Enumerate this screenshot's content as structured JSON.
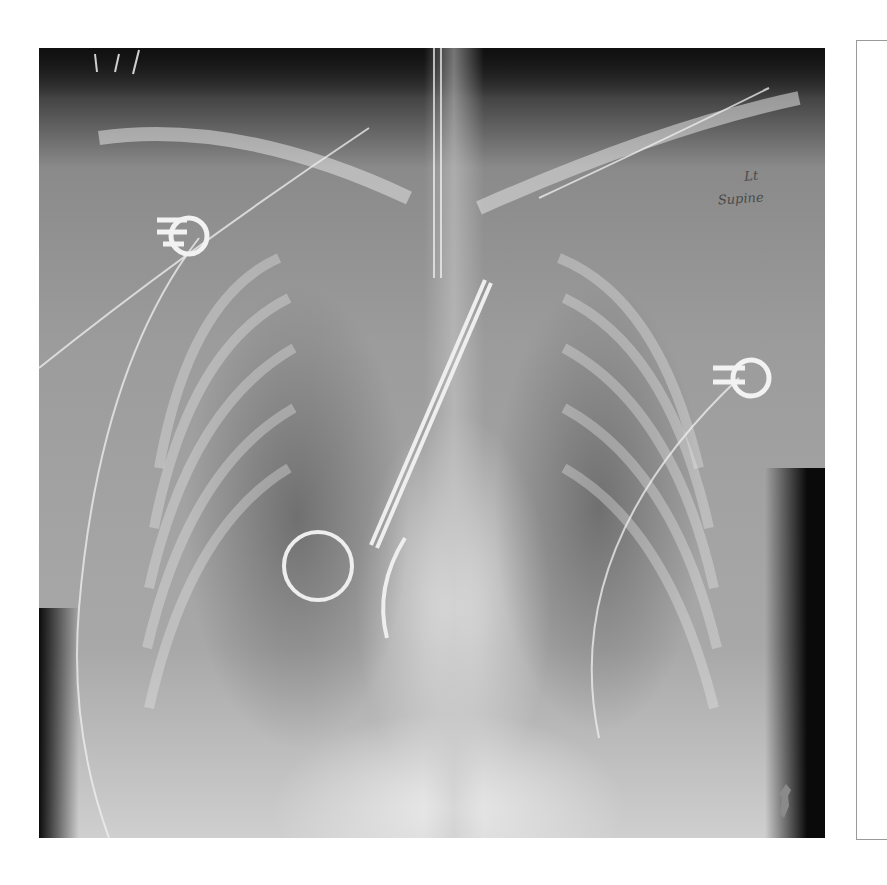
{
  "image": {
    "type": "chest radiograph",
    "view": "AP supine",
    "annotation": {
      "line1": "Lt",
      "line2": "Supine"
    },
    "visible_devices": [
      "ecg-electrode-right",
      "ecg-electrode-left",
      "ring-clamp-instrument",
      "lead-wires"
    ]
  },
  "colors": {
    "background": "#ffffff",
    "film_dark": "#1e1e1e",
    "film_mid": "#9c9c9c",
    "film_light": "#d8d8d8",
    "frame": "#9a9a9a",
    "annotation_ink": "#4a4a4a"
  }
}
